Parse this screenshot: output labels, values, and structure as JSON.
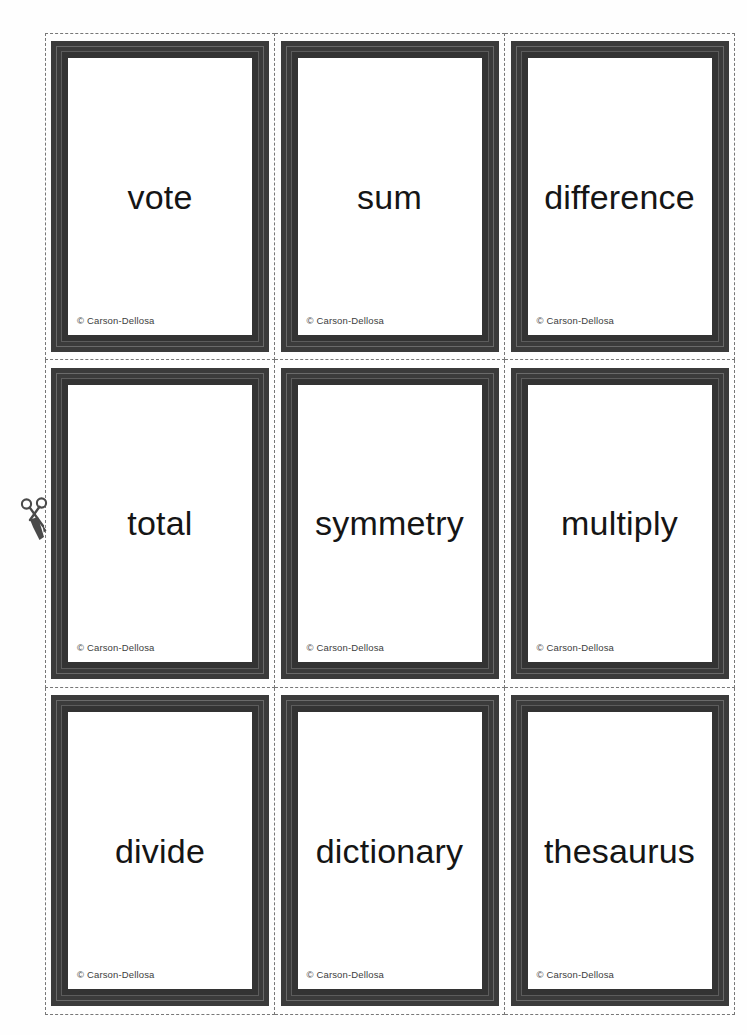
{
  "page": {
    "background_color": "#ffffff",
    "cut_line_color": "#777777",
    "card_frame_color": "#3b3b3b",
    "word_color": "#151515"
  },
  "cut_guide": {
    "scissors_icon": "scissors-icon",
    "label": "cut along dashed lines"
  },
  "copyright_text": "© Carson-Dellosa",
  "cards": [
    {
      "word": "vote",
      "copyright": "© Carson-Dellosa"
    },
    {
      "word": "sum",
      "copyright": "© Carson-Dellosa"
    },
    {
      "word": "difference",
      "copyright": "© Carson-Dellosa"
    },
    {
      "word": "total",
      "copyright": "© Carson-Dellosa"
    },
    {
      "word": "symmetry",
      "copyright": "© Carson-Dellosa"
    },
    {
      "word": "multiply",
      "copyright": "© Carson-Dellosa"
    },
    {
      "word": "divide",
      "copyright": "© Carson-Dellosa"
    },
    {
      "word": "dictionary",
      "copyright": "© Carson-Dellosa"
    },
    {
      "word": "thesaurus",
      "copyright": "© Carson-Dellosa"
    }
  ]
}
